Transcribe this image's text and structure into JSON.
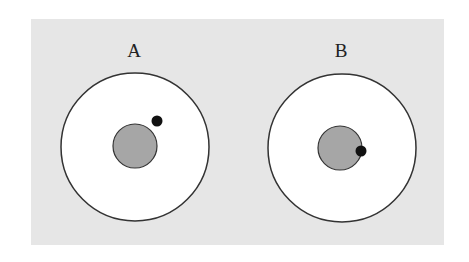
{
  "diagram": {
    "panels": [
      {
        "label": "A",
        "outer_circle": {
          "cx": 135,
          "cy": 147,
          "r": 74
        },
        "inner_circle": {
          "cx": 135,
          "cy": 146,
          "r": 22
        },
        "dot": {
          "cx": 157,
          "cy": 121,
          "r": 5.5
        }
      },
      {
        "label": "B",
        "outer_circle": {
          "cx": 342,
          "cy": 148,
          "r": 74
        },
        "inner_circle": {
          "cx": 340,
          "cy": 148,
          "r": 22
        },
        "dot": {
          "cx": 361,
          "cy": 151,
          "r": 5.5
        }
      }
    ],
    "colors": {
      "background": "#e6e6e6",
      "outer_fill": "#ffffff",
      "inner_fill": "#a6a6a6",
      "dot_fill": "#111111",
      "stroke": "#333333"
    }
  }
}
